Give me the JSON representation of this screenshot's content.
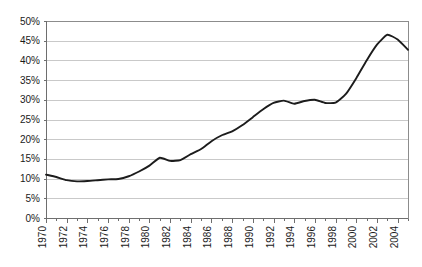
{
  "chart_data": {
    "type": "line",
    "title": "",
    "subtitle": "",
    "xlabel": "",
    "ylabel": "",
    "grid": true,
    "legend": false,
    "legend_position": "none",
    "line_color": "#1c1c1c",
    "gridline_color": "#c9c9c9",
    "axis_color": "#6e6e6e",
    "background_color": "#ffffff",
    "xlim": [
      1970,
      2005
    ],
    "ylim": [
      0,
      50
    ],
    "y_tick_step": 5,
    "x_tick_step": 1,
    "x_label_step": 2,
    "y_tick_labels": [
      "0%",
      "5%",
      "10%",
      "15%",
      "20%",
      "25%",
      "30%",
      "35%",
      "40%",
      "45%",
      "50%"
    ],
    "y_tick_values": [
      0,
      5,
      10,
      15,
      20,
      25,
      30,
      35,
      40,
      45,
      50
    ],
    "x_tick_labels": [
      "1970",
      "1972",
      "1974",
      "1976",
      "1978",
      "1980",
      "1982",
      "1984",
      "1986",
      "1988",
      "1990",
      "1992",
      "1994",
      "1996",
      "1998",
      "2000",
      "2002",
      "2004"
    ],
    "x_tick_values": [
      1970,
      1972,
      1974,
      1976,
      1978,
      1980,
      1982,
      1984,
      1986,
      1988,
      1990,
      1992,
      1994,
      1996,
      1998,
      2000,
      2002,
      2004
    ],
    "x_label_rotation": -90,
    "x": [
      1970,
      1971,
      1972,
      1973,
      1974,
      1975,
      1976,
      1977,
      1978,
      1979,
      1980,
      1981,
      1982,
      1983,
      1984,
      1985,
      1986,
      1987,
      1988,
      1989,
      1990,
      1991,
      1992,
      1993,
      1994,
      1995,
      1996,
      1997,
      1998,
      1999,
      2000,
      2001,
      2002,
      2003,
      2004,
      2005
    ],
    "values": [
      11.0,
      10.4,
      9.6,
      9.3,
      9.4,
      9.6,
      9.8,
      9.9,
      10.6,
      11.8,
      13.3,
      15.3,
      14.5,
      14.7,
      16.2,
      17.5,
      19.5,
      21.0,
      22.0,
      23.6,
      25.6,
      27.6,
      29.2,
      29.8,
      29.0,
      29.7,
      30.0,
      29.2,
      29.3,
      31.5,
      35.5,
      40.0,
      44.0,
      46.5,
      45.3,
      42.7
    ],
    "series": [
      {
        "name": "share",
        "values": [
          11.0,
          10.4,
          9.6,
          9.3,
          9.4,
          9.6,
          9.8,
          9.9,
          10.6,
          11.8,
          13.3,
          15.3,
          14.5,
          14.7,
          16.2,
          17.5,
          19.5,
          21.0,
          22.0,
          23.6,
          25.6,
          27.6,
          29.2,
          29.8,
          29.0,
          29.7,
          30.0,
          29.2,
          29.3,
          31.5,
          35.5,
          40.0,
          44.0,
          46.5,
          45.3,
          42.7
        ]
      }
    ],
    "annotations": []
  },
  "chart_geometry": {
    "plot_left": 46,
    "plot_right": 408,
    "plot_top": 21,
    "plot_bottom": 218
  }
}
